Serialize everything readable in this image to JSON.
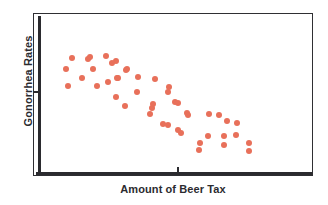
{
  "chart_data": {
    "type": "scatter",
    "title": "",
    "xlabel": "Amount of Beer Tax",
    "ylabel": "Gonorrhea Rates",
    "grid": false,
    "legend": null,
    "xlim": [
      0,
      100
    ],
    "ylim": [
      0,
      100
    ],
    "xticks": [
      52
    ],
    "yticks": [
      52
    ],
    "xticklabels": [
      ""
    ],
    "yticklabels": [
      ""
    ],
    "marker_color": "#e8705a",
    "axis_color": "#2b2b2f",
    "relationship": "negative",
    "n_points": 46,
    "points": [
      {
        "x": 14.1,
        "y": 72.4
      },
      {
        "x": 19.6,
        "y": 71.8
      },
      {
        "x": 20.4,
        "y": 73.0
      },
      {
        "x": 26.1,
        "y": 73.6
      },
      {
        "x": 29.6,
        "y": 70.6
      },
      {
        "x": 11.8,
        "y": 65.6
      },
      {
        "x": 21.4,
        "y": 65.6
      },
      {
        "x": 33.6,
        "y": 65.6
      },
      {
        "x": 17.5,
        "y": 60.1
      },
      {
        "x": 30.4,
        "y": 60.1
      },
      {
        "x": 12.5,
        "y": 55.2
      },
      {
        "x": 22.9,
        "y": 55.2
      },
      {
        "x": 26.8,
        "y": 57.7
      },
      {
        "x": 28.2,
        "y": 69.3
      },
      {
        "x": 33.2,
        "y": 65.0
      },
      {
        "x": 30.0,
        "y": 60.1
      },
      {
        "x": 37.5,
        "y": 60.7
      },
      {
        "x": 43.6,
        "y": 59.5
      },
      {
        "x": 48.6,
        "y": 54.6
      },
      {
        "x": 29.6,
        "y": 48.5
      },
      {
        "x": 32.9,
        "y": 43.0
      },
      {
        "x": 37.1,
        "y": 51.5
      },
      {
        "x": 42.5,
        "y": 41.7
      },
      {
        "x": 50.7,
        "y": 45.4
      },
      {
        "x": 48.2,
        "y": 51.5
      },
      {
        "x": 42.9,
        "y": 44.2
      },
      {
        "x": 51.8,
        "y": 44.8
      },
      {
        "x": 41.8,
        "y": 38.0
      },
      {
        "x": 55.0,
        "y": 38.7
      },
      {
        "x": 48.2,
        "y": 31.3
      },
      {
        "x": 55.4,
        "y": 37.4
      },
      {
        "x": 62.9,
        "y": 38.0
      },
      {
        "x": 66.4,
        "y": 37.4
      },
      {
        "x": 69.3,
        "y": 33.7
      },
      {
        "x": 72.9,
        "y": 32.5
      },
      {
        "x": 46.4,
        "y": 31.9
      },
      {
        "x": 51.8,
        "y": 28.2
      },
      {
        "x": 52.9,
        "y": 26.4
      },
      {
        "x": 62.5,
        "y": 24.5
      },
      {
        "x": 68.2,
        "y": 24.5
      },
      {
        "x": 59.6,
        "y": 20.2
      },
      {
        "x": 68.2,
        "y": 19.0
      },
      {
        "x": 72.5,
        "y": 25.2
      },
      {
        "x": 77.1,
        "y": 20.2
      },
      {
        "x": 59.3,
        "y": 16.0
      },
      {
        "x": 77.1,
        "y": 15.3
      }
    ]
  },
  "axes": {
    "y_title": "Gonorrhea Rates",
    "x_title": "Amount of Beer Tax"
  }
}
